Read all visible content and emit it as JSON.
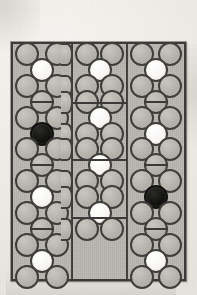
{
  "figure": {
    "name": "three-column hexagonal packing diagram",
    "background_color": "#efece7",
    "panel_fill": "#b9b6b0",
    "line_color": "#3b3a38",
    "marker_colors": {
      "ring": "#b4b1ab",
      "white": "#ffffff",
      "black": "#0b0b0a"
    },
    "columns": [
      {
        "id": "left",
        "label": "",
        "horizontal_dividers": [],
        "rows": [
          {
            "type": "pair",
            "cells": [
              "ring",
              "ring"
            ]
          },
          {
            "type": "single",
            "cells": [
              "white"
            ]
          },
          {
            "type": "pair",
            "cells": [
              "ring",
              "ring"
            ]
          },
          {
            "type": "single",
            "cells": [
              "barred"
            ]
          },
          {
            "type": "pair",
            "cells": [
              "ring",
              "ring"
            ]
          },
          {
            "type": "single",
            "cells": [
              "black"
            ]
          },
          {
            "type": "pair",
            "cells": [
              "ring",
              "ring"
            ]
          },
          {
            "type": "single",
            "cells": [
              "barred"
            ]
          },
          {
            "type": "pair",
            "cells": [
              "ring",
              "ring"
            ]
          },
          {
            "type": "single",
            "cells": [
              "white"
            ]
          },
          {
            "type": "pair",
            "cells": [
              "ring",
              "ring"
            ]
          },
          {
            "type": "single",
            "cells": [
              "barred"
            ]
          },
          {
            "type": "pair",
            "cells": [
              "ring",
              "ring"
            ]
          },
          {
            "type": "single",
            "cells": [
              "white"
            ]
          },
          {
            "type": "pair",
            "cells": [
              "ring",
              "ring"
            ]
          }
        ]
      },
      {
        "id": "middle",
        "label": "",
        "horizontal_dividers": [
          100,
          157,
          215
        ],
        "rows": [
          {
            "type": "pair",
            "cells": [
              "ring",
              "ring"
            ]
          },
          {
            "type": "single",
            "cells": [
              "white"
            ]
          },
          {
            "type": "pair",
            "cells": [
              "ring",
              "ring"
            ]
          },
          {
            "type": "pair",
            "cells": [
              "ring",
              "ring"
            ]
          },
          {
            "type": "single",
            "cells": [
              "white"
            ]
          },
          {
            "type": "pair",
            "cells": [
              "ring",
              "ring"
            ]
          },
          {
            "type": "pair",
            "cells": [
              "ring",
              "ring"
            ]
          },
          {
            "type": "single",
            "cells": [
              "white"
            ]
          },
          {
            "type": "pair",
            "cells": [
              "ring",
              "ring"
            ]
          },
          {
            "type": "pair",
            "cells": [
              "ring",
              "ring"
            ]
          },
          {
            "type": "single",
            "cells": [
              "white"
            ]
          },
          {
            "type": "pair",
            "cells": [
              "ring",
              "ring"
            ]
          }
        ]
      },
      {
        "id": "right",
        "label": "",
        "horizontal_dividers": [],
        "rows": [
          {
            "type": "pair",
            "cells": [
              "ring",
              "ring"
            ]
          },
          {
            "type": "single",
            "cells": [
              "white"
            ]
          },
          {
            "type": "pair",
            "cells": [
              "ring",
              "ring"
            ]
          },
          {
            "type": "single",
            "cells": [
              "barred"
            ]
          },
          {
            "type": "pair",
            "cells": [
              "ring",
              "ring"
            ]
          },
          {
            "type": "single",
            "cells": [
              "white"
            ]
          },
          {
            "type": "pair",
            "cells": [
              "ring",
              "ring"
            ]
          },
          {
            "type": "single",
            "cells": [
              "barred"
            ]
          },
          {
            "type": "pair",
            "cells": [
              "ring",
              "ring"
            ]
          },
          {
            "type": "single",
            "cells": [
              "black"
            ]
          },
          {
            "type": "pair",
            "cells": [
              "ring",
              "ring"
            ]
          },
          {
            "type": "single",
            "cells": [
              "barred"
            ]
          },
          {
            "type": "pair",
            "cells": [
              "ring",
              "ring"
            ]
          },
          {
            "type": "single",
            "cells": [
              "white"
            ]
          },
          {
            "type": "pair",
            "cells": [
              "ring",
              "ring"
            ]
          }
        ]
      }
    ]
  }
}
